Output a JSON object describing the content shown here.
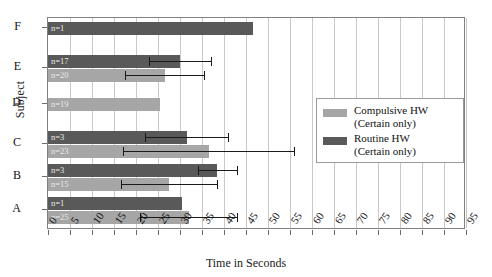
{
  "chart_data": {
    "type": "bar",
    "orientation": "horizontal",
    "title": "",
    "xlabel": "Time in Seconds",
    "ylabel": "Subject",
    "xlim": [
      0,
      95
    ],
    "xticks": [
      0,
      5,
      10,
      15,
      20,
      25,
      30,
      35,
      40,
      45,
      50,
      55,
      60,
      65,
      70,
      75,
      80,
      85,
      90,
      95
    ],
    "grid": "vertical",
    "categories": [
      "F",
      "E",
      "D",
      "C",
      "B",
      "A"
    ],
    "legend_position": "right-middle",
    "series": [
      {
        "name": "Compulsive HW (Certain only)",
        "color": "#a6a6a6",
        "values": [
          null,
          26.5,
          25.5,
          36.5,
          27.5,
          32.0
        ],
        "errors": [
          null,
          9.0,
          0,
          19.5,
          11.0,
          11.0
        ],
        "n_labels": [
          null,
          "n=20",
          "n=19",
          "n=23",
          "n=15",
          "n=25"
        ]
      },
      {
        "name": "Routine HW (Certain only)",
        "color": "#595959",
        "values": [
          46.5,
          30.0,
          null,
          31.5,
          38.5,
          30.5
        ],
        "errors": [
          null,
          7.0,
          null,
          9.5,
          4.5,
          null
        ],
        "n_labels": [
          "n=1",
          "n=17",
          null,
          "n=3",
          "n=3",
          "n=1"
        ]
      }
    ]
  },
  "axes": {
    "x_title": "Time in Seconds",
    "y_title": "Subject",
    "x_tick_labels": [
      "0",
      "5",
      "10",
      "15",
      "20",
      "25",
      "30",
      "35",
      "40",
      "45",
      "50",
      "55",
      "60",
      "65",
      "70",
      "75",
      "80",
      "85",
      "90",
      "95"
    ],
    "y_tick_labels": [
      "F",
      "E",
      "D",
      "C",
      "B",
      "A"
    ]
  },
  "legend": {
    "items": [
      {
        "label_line1": "Compulsive HW",
        "label_line2": "(Certain only)",
        "color": "#a6a6a6"
      },
      {
        "label_line1": "Routine HW",
        "label_line2": "(Certain only)",
        "color": "#595959"
      }
    ]
  },
  "bar_labels": {
    "F_routine": "n=1",
    "E_routine": "n=17",
    "E_compulsive": "n=20",
    "D_compulsive": "n=19",
    "C_routine": "n=3",
    "C_compulsive": "n=23",
    "B_routine": "n=3",
    "B_compulsive": "n=15",
    "A_routine": "n=1",
    "A_compulsive": "n=25"
  }
}
